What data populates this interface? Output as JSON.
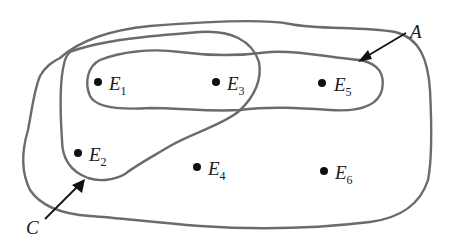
{
  "diagram": {
    "type": "set-diagram",
    "outline_color": "#6b6b6b",
    "point_color": "#111111",
    "sets": [
      {
        "name": "A",
        "label": "A",
        "members": [
          "E1",
          "E3",
          "E5"
        ]
      },
      {
        "name": "C",
        "label": "C",
        "members": [
          "E1",
          "E3",
          "E2"
        ]
      }
    ],
    "universe_members": [
      "E1",
      "E2",
      "E3",
      "E4",
      "E5",
      "E6"
    ],
    "points": [
      {
        "id": "E1",
        "letter": "E",
        "sub": "1"
      },
      {
        "id": "E2",
        "letter": "E",
        "sub": "2"
      },
      {
        "id": "E3",
        "letter": "E",
        "sub": "3"
      },
      {
        "id": "E4",
        "letter": "E",
        "sub": "4"
      },
      {
        "id": "E5",
        "letter": "E",
        "sub": "5"
      },
      {
        "id": "E6",
        "letter": "E",
        "sub": "6"
      }
    ],
    "set_labels": {
      "A": "A",
      "C": "C"
    }
  }
}
